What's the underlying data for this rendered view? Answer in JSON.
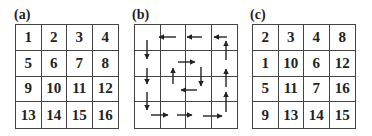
{
  "panels": {
    "a": {
      "label": "(a)",
      "rows": [
        [
          "1",
          "2",
          "3",
          "4"
        ],
        [
          "5",
          "6",
          "7",
          "8"
        ],
        [
          "9",
          "10",
          "11",
          "12"
        ],
        [
          "13",
          "14",
          "15",
          "16"
        ]
      ]
    },
    "b": {
      "label": "(b)",
      "description": "Spiral traversal arrows: outer ring counter-clockwise (left along top, down left column, right along bottom, up right column), inner ring right-down-left-up",
      "arrow_color": "#222222"
    },
    "c": {
      "label": "(c)",
      "rows": [
        [
          "2",
          "3",
          "4",
          "8"
        ],
        [
          "1",
          "10",
          "6",
          "12"
        ],
        [
          "5",
          "11",
          "7",
          "16"
        ],
        [
          "9",
          "13",
          "14",
          "15"
        ]
      ]
    }
  }
}
